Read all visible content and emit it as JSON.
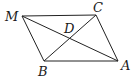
{
  "diagram": {
    "type": "parallelogram-with-diagonals",
    "points": {
      "M": {
        "label": "M",
        "x": 22,
        "y": 16
      },
      "C": {
        "label": "C",
        "x": 96,
        "y": 15
      },
      "A": {
        "label": "A",
        "x": 118,
        "y": 61
      },
      "B": {
        "label": "B",
        "x": 44,
        "y": 61
      },
      "D": {
        "label": "D",
        "x": 70,
        "y": 37
      }
    },
    "segments": [
      "MC",
      "CA",
      "AB",
      "BM",
      "MA",
      "BC"
    ],
    "colors": {
      "line": "#222222",
      "text": "#1a1a1a",
      "background": "#ffffff"
    }
  }
}
